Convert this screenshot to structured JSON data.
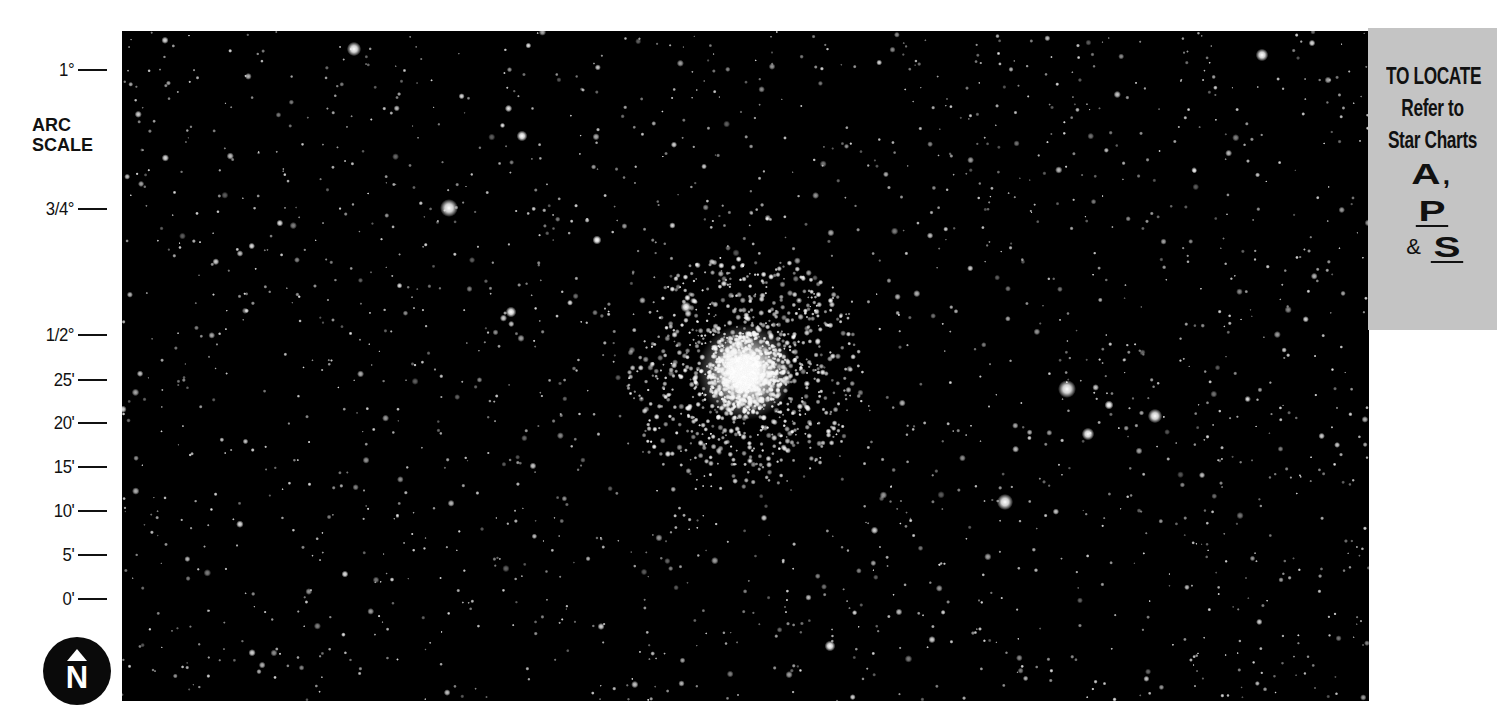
{
  "arc_scale": {
    "title_line1": "ARC",
    "title_line2": "SCALE",
    "ticks": [
      {
        "label": "1°",
        "y": 70
      },
      {
        "label": "3/4°",
        "y": 209
      },
      {
        "label": "1/2°",
        "y": 335
      },
      {
        "label": "25'",
        "y": 380
      },
      {
        "label": "20'",
        "y": 423
      },
      {
        "label": "15'",
        "y": 467
      },
      {
        "label": "10'",
        "y": 511
      },
      {
        "label": "5'",
        "y": 555
      },
      {
        "label": "0'",
        "y": 599
      }
    ]
  },
  "north_indicator": {
    "letter": "N"
  },
  "locate_panel": {
    "line1": "TO LOCATE",
    "line2": "Refer to",
    "line3": "Star Charts",
    "charts": [
      "A",
      "P",
      "S"
    ],
    "comma": ",",
    "ampersand": "&"
  },
  "photo": {
    "subject": "globular star cluster field",
    "background_color": "#000000",
    "cluster_center": {
      "x": 745,
      "y": 372
    },
    "bright_stars": [
      {
        "x": 354,
        "y": 49,
        "r": 4
      },
      {
        "x": 449,
        "y": 208,
        "r": 5
      },
      {
        "x": 522,
        "y": 136,
        "r": 3
      },
      {
        "x": 511,
        "y": 312,
        "r": 3
      },
      {
        "x": 597,
        "y": 240,
        "r": 2.5
      },
      {
        "x": 686,
        "y": 307,
        "r": 3
      },
      {
        "x": 1067,
        "y": 389,
        "r": 5
      },
      {
        "x": 1109,
        "y": 405,
        "r": 2.5
      },
      {
        "x": 1155,
        "y": 416,
        "r": 4
      },
      {
        "x": 1088,
        "y": 434,
        "r": 3.5
      },
      {
        "x": 1005,
        "y": 502,
        "r": 4.5
      },
      {
        "x": 1262,
        "y": 55,
        "r": 3.5
      },
      {
        "x": 830,
        "y": 646,
        "r": 3
      }
    ]
  },
  "colors": {
    "panel_gray": "#c4c4c4",
    "ink": "#111111",
    "page": "#ffffff"
  }
}
